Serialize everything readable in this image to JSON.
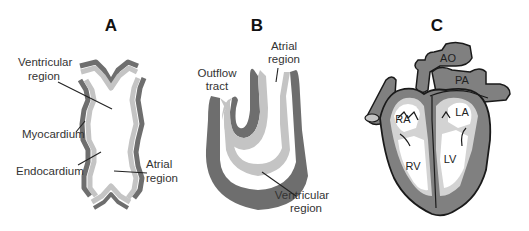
{
  "figure": {
    "colors": {
      "myocardium": "#6e6e6e",
      "endocardium": "#c4c4c4",
      "heart_wall": "#808080",
      "heart_inner": "#d3d3d3",
      "outline": "#1a1a1a",
      "background": "#ffffff"
    },
    "panels": [
      {
        "id": "A",
        "title": "A",
        "description": "Linear heart tube",
        "labels": {
          "ventricular": [
            "Ventricular",
            "region"
          ],
          "myocardium": "Myocardium",
          "endocardium": "Endocardium",
          "atrial": [
            "Atrial",
            "region"
          ]
        }
      },
      {
        "id": "B",
        "title": "B",
        "description": "Looping heart tube",
        "labels": {
          "outflow": [
            "Outflow",
            "tract"
          ],
          "atrial": [
            "Atrial",
            "region"
          ],
          "ventricular": [
            "Ventricular",
            "region"
          ]
        }
      },
      {
        "id": "C",
        "title": "C",
        "description": "Mature four-chambered heart",
        "labels": {
          "ao": "AO",
          "pa": "PA",
          "ra": "RA",
          "la": "LA",
          "rv": "RV",
          "lv": "LV"
        }
      }
    ]
  }
}
